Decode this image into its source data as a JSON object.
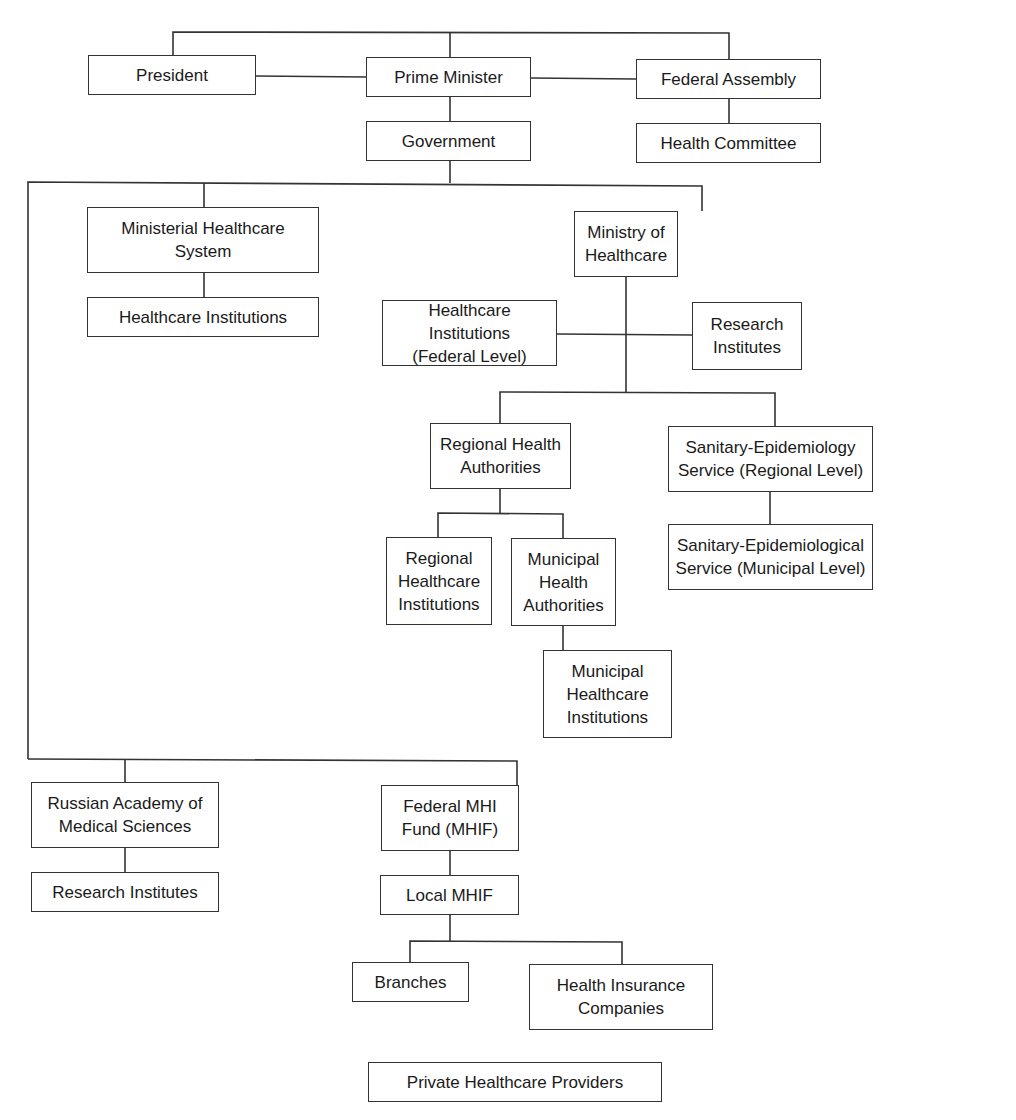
{
  "diagram": {
    "type": "org-chart",
    "title": "",
    "line_color": "#333333",
    "nodes": [
      {
        "id": "president",
        "label": "President"
      },
      {
        "id": "prime_minister",
        "label": "Prime Minister"
      },
      {
        "id": "federal_assembly",
        "label": "Federal Assembly"
      },
      {
        "id": "government",
        "label": "Government"
      },
      {
        "id": "health_committee",
        "label": "Health Committee"
      },
      {
        "id": "ministerial_system",
        "label": "Ministerial Healthcare\nSystem"
      },
      {
        "id": "healthcare_institutions",
        "label": "Healthcare Institutions"
      },
      {
        "id": "ministry_of_healthcare",
        "label": "Ministry of\nHealthcare"
      },
      {
        "id": "hc_institutions_federal",
        "label": "Healthcare Institutions\n(Federal Level)"
      },
      {
        "id": "research_institutes_ministry",
        "label": "Research\nInstitutes"
      },
      {
        "id": "regional_health_authorities",
        "label": "Regional Health\nAuthorities"
      },
      {
        "id": "sanepid_regional",
        "label": "Sanitary-Epidemiology\nService (Regional Level)"
      },
      {
        "id": "regional_hc_institutions",
        "label": "Regional\nHealthcare\nInstitutions"
      },
      {
        "id": "municipal_health_authorities",
        "label": "Municipal\nHealth\nAuthorities"
      },
      {
        "id": "sanepid_municipal",
        "label": "Sanitary-Epidemiological\nService (Municipal Level)"
      },
      {
        "id": "municipal_hc_institutions",
        "label": "Municipal\nHealthcare\nInstitutions"
      },
      {
        "id": "russian_academy",
        "label": "Russian Academy of\nMedical Sciences"
      },
      {
        "id": "research_institutes_academy",
        "label": "Research Institutes"
      },
      {
        "id": "federal_mhif",
        "label": "Federal MHI\nFund (MHIF)"
      },
      {
        "id": "local_mhif",
        "label": "Local MHIF"
      },
      {
        "id": "branches",
        "label": "Branches"
      },
      {
        "id": "health_insurance_companies",
        "label": "Health Insurance\nCompanies"
      },
      {
        "id": "private_providers",
        "label": "Private Healthcare Providers"
      }
    ],
    "edges": [
      [
        "president",
        "prime_minister"
      ],
      [
        "prime_minister",
        "federal_assembly"
      ],
      [
        "prime_minister",
        "government"
      ],
      [
        "federal_assembly",
        "health_committee"
      ],
      [
        "government",
        "ministerial_system"
      ],
      [
        "government",
        "ministry_of_healthcare"
      ],
      [
        "ministerial_system",
        "healthcare_institutions"
      ],
      [
        "ministry_of_healthcare",
        "hc_institutions_federal"
      ],
      [
        "ministry_of_healthcare",
        "research_institutes_ministry"
      ],
      [
        "ministry_of_healthcare",
        "regional_health_authorities"
      ],
      [
        "ministry_of_healthcare",
        "sanepid_regional"
      ],
      [
        "regional_health_authorities",
        "regional_hc_institutions"
      ],
      [
        "regional_health_authorities",
        "municipal_health_authorities"
      ],
      [
        "municipal_health_authorities",
        "municipal_hc_institutions"
      ],
      [
        "sanepid_regional",
        "sanepid_municipal"
      ],
      [
        "government",
        "russian_academy"
      ],
      [
        "government",
        "federal_mhif"
      ],
      [
        "russian_academy",
        "research_institutes_academy"
      ],
      [
        "federal_mhif",
        "local_mhif"
      ],
      [
        "local_mhif",
        "branches"
      ],
      [
        "local_mhif",
        "health_insurance_companies"
      ]
    ]
  }
}
